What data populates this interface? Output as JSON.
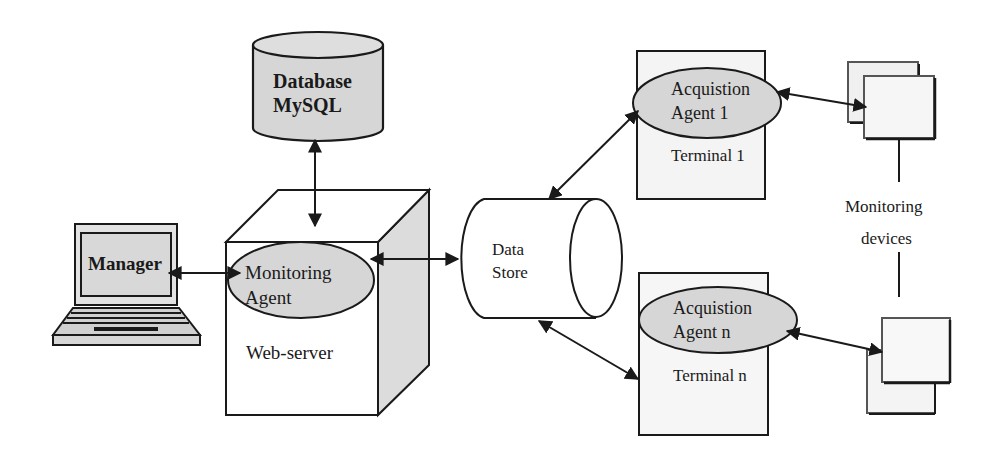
{
  "diagram": {
    "type": "system-architecture",
    "colors": {
      "stroke": "#1a1a1a",
      "fill_gray": "#d6d6d6",
      "fill_light": "#f4f4f4",
      "background": "#ffffff"
    },
    "nodes": {
      "database": {
        "line1": "Database",
        "line2": "MySQL",
        "shape": "cylinder"
      },
      "manager": {
        "label": "Manager",
        "shape": "laptop"
      },
      "monitoring_agent": {
        "line1": "Monitoring",
        "line2": "Agent",
        "shape": "ellipse"
      },
      "web_server": {
        "label": "Web-server",
        "shape": "cube"
      },
      "data_store": {
        "line1": "Data",
        "line2": "Store",
        "shape": "horizontal-cylinder"
      },
      "terminal_1": {
        "label": "Terminal 1",
        "agent_line1": "Acquistion",
        "agent_line2": "Agent 1"
      },
      "terminal_n": {
        "label": "Terminal n",
        "agent_line1": "Acquistion",
        "agent_line2": "Agent n"
      },
      "devices": {
        "line1": "Monitoring",
        "line2": "devices"
      }
    },
    "edges": [
      {
        "from": "database",
        "to": "monitoring_agent",
        "bidirectional": true
      },
      {
        "from": "manager",
        "to": "monitoring_agent",
        "bidirectional": true
      },
      {
        "from": "web_server",
        "to": "data_store",
        "bidirectional": true
      },
      {
        "from": "data_store",
        "to": "terminal_1",
        "bidirectional": true
      },
      {
        "from": "data_store",
        "to": "terminal_n",
        "bidirectional": true
      },
      {
        "from": "terminal_1",
        "to": "devices",
        "bidirectional": true
      },
      {
        "from": "terminal_n",
        "to": "devices",
        "bidirectional": true
      }
    ]
  }
}
